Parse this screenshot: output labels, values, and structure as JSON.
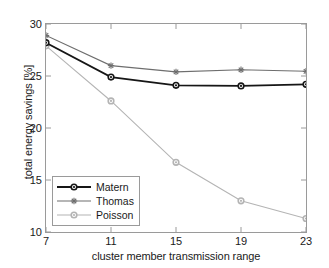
{
  "chart_data": {
    "type": "line",
    "title": "",
    "xlabel": "cluster member transmission range",
    "ylabel": "total energy savings [%]",
    "x": [
      7,
      11,
      15,
      19,
      23
    ],
    "xticklabels": [
      "7",
      "11",
      "15",
      "19",
      "23"
    ],
    "yticklabels": [
      "10",
      "15",
      "20",
      "25",
      "30"
    ],
    "yticks": [
      10,
      15,
      20,
      25,
      30
    ],
    "xlim": [
      7,
      23
    ],
    "ylim": [
      10,
      30
    ],
    "grid": false,
    "legend_position": "lower left",
    "series": [
      {
        "name": "Matern",
        "values": [
          28.2,
          24.9,
          24.1,
          24.05,
          24.2
        ],
        "color": "#161616",
        "marker": "circle",
        "linewidth": 1.8
      },
      {
        "name": "Thomas",
        "values": [
          28.9,
          26.0,
          25.4,
          25.6,
          25.45
        ],
        "color": "#6e6e6e",
        "marker": "star",
        "linewidth": 1.1
      },
      {
        "name": "Poisson",
        "values": [
          27.9,
          22.6,
          16.7,
          13.0,
          11.3
        ],
        "color": "#b4b4b4",
        "marker": "circle",
        "linewidth": 1.1
      }
    ]
  },
  "legend": {
    "items": [
      {
        "label": "Matern"
      },
      {
        "label": "Thomas"
      },
      {
        "label": "Poisson"
      }
    ]
  }
}
